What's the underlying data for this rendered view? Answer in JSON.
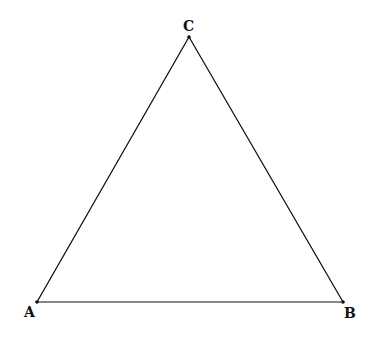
{
  "diagram": {
    "type": "triangle",
    "stroke_color": "#111111",
    "vertices": [
      {
        "label": "A",
        "x": 37,
        "y": 302,
        "label_x": 24,
        "label_y": 317
      },
      {
        "label": "B",
        "x": 343,
        "y": 302,
        "label_x": 344,
        "label_y": 318
      },
      {
        "label": "C",
        "x": 189,
        "y": 37,
        "label_x": 183,
        "label_y": 31
      }
    ]
  }
}
